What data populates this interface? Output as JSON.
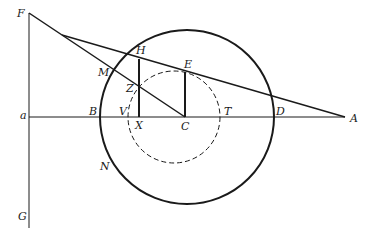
{
  "diagram": {
    "type": "geometric construction",
    "labels": {
      "F": "F",
      "H": "H",
      "E": "E",
      "M": "M",
      "Z": "Z",
      "a": "a",
      "B": "B",
      "V": "V",
      "X": "X",
      "C": "C",
      "T": "T",
      "D": "D",
      "A": "A",
      "N": "N",
      "G": "G"
    },
    "colors": {
      "ink": "#1a1a1a",
      "background": "#ffffff"
    },
    "elements": [
      "outer circle centered at C (solid, thick)",
      "inner circle (dashed)",
      "horizontal line aA through B, V, X, C, T, D",
      "vertical line FaG",
      "line F to A region through M, Z",
      "line from intersection through H, E to A",
      "vertical segment HX",
      "vertical segment EC",
      "segment ZC"
    ]
  }
}
